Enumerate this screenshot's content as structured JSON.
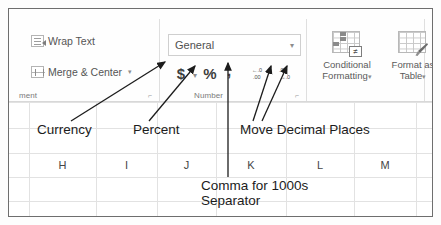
{
  "app": {
    "name": "Excel Ribbon",
    "context": "Home tab - Alignment and Number groups with instructional annotations"
  },
  "ribbon": {
    "alignment_group": {
      "label": "ment",
      "dialog_launcher": "⌐",
      "commands": [
        {
          "icon": "wrap-text-icon",
          "label": "Wrap Text",
          "caret": ""
        },
        {
          "icon": "merge-center-icon",
          "label": "Merge & Center",
          "caret": "▾"
        }
      ]
    },
    "number_group": {
      "label": "Number",
      "dialog_launcher": "⌐",
      "format_combo": {
        "value": "General",
        "placeholder": "General",
        "caret": "▾"
      },
      "buttons": [
        {
          "name": "currency-button",
          "glyph": "$",
          "caret": "▾"
        },
        {
          "name": "percent-button",
          "glyph": "%",
          "caret": ""
        },
        {
          "name": "comma-style-button",
          "glyph": ",",
          "caret": ""
        },
        {
          "name": "increase-decimal-button",
          "row1": "←.0",
          "row2": ".00",
          "caret": ""
        },
        {
          "name": "decrease-decimal-button",
          "row1": ".00",
          "row2": "→.0",
          "caret": ""
        }
      ]
    },
    "styles_group": {
      "buttons": [
        {
          "name": "conditional-formatting-button",
          "icon": "conditional-format-icon",
          "line1": "Conditional",
          "line2": "Formatting",
          "caret": "▾"
        },
        {
          "name": "format-as-table-button",
          "icon": "format-table-icon",
          "line1": "Format as",
          "line2": "Table",
          "caret": "▾"
        }
      ]
    }
  },
  "worksheet": {
    "column_headers": [
      "H",
      "I",
      "J",
      "K",
      "L",
      "M"
    ]
  },
  "annotations": [
    {
      "name": "annotation-currency",
      "text": "Currency"
    },
    {
      "name": "annotation-percent",
      "text": "Percent"
    },
    {
      "name": "annotation-move-decimal-places",
      "text": "Move Decimal Places"
    },
    {
      "name": "annotation-comma-line1",
      "text": "Comma for 1000s"
    },
    {
      "name": "annotation-comma-line2",
      "text": "Separator"
    }
  ],
  "colors": {
    "frame_border": "#6e6e6e",
    "ribbon_text": "#555555",
    "annotation_text": "#1c1c1c",
    "gridline": "#e2e2e2"
  }
}
